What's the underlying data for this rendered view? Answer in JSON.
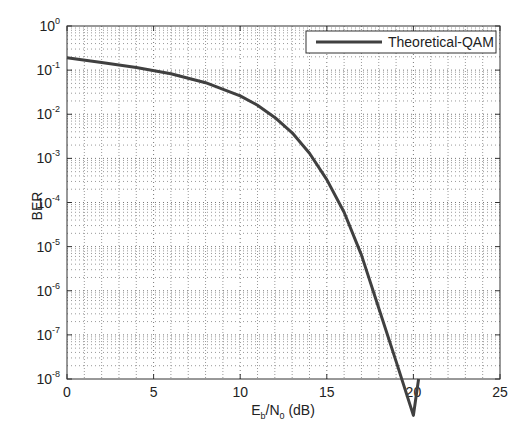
{
  "chart_data": {
    "type": "line",
    "title": "",
    "xlabel": "E_b/N_0 (dB)",
    "xlabel_parts": {
      "base1": "E",
      "sub1": "b",
      "mid": "/N",
      "sub2": "0",
      "tail": " (dB)"
    },
    "ylabel": "BER",
    "xlim": [
      0,
      25
    ],
    "ylim": [
      1e-08,
      1
    ],
    "yscale": "log",
    "grid": true,
    "grid_style": "dotted, major and minor",
    "legend_position": "upper right",
    "x_ticks": [
      "0",
      "5",
      "10",
      "15",
      "20",
      "25"
    ],
    "y_ticks": [
      {
        "base": "10",
        "exp": "0"
      },
      {
        "base": "10",
        "exp": "-1"
      },
      {
        "base": "10",
        "exp": "-2"
      },
      {
        "base": "10",
        "exp": "-3"
      },
      {
        "base": "10",
        "exp": "-4"
      },
      {
        "base": "10",
        "exp": "-5"
      },
      {
        "base": "10",
        "exp": "-6"
      },
      {
        "base": "10",
        "exp": "-7"
      },
      {
        "base": "10",
        "exp": "-8"
      }
    ],
    "series": [
      {
        "name": "Theoretical-QAM",
        "color": "#404040",
        "x": [
          0,
          2,
          4,
          6,
          8,
          10,
          11,
          12,
          13,
          14,
          15,
          16,
          17,
          18,
          19,
          20,
          20.3
        ],
        "values": [
          0.19,
          0.15,
          0.115,
          0.083,
          0.052,
          0.026,
          0.016,
          0.0085,
          0.0038,
          0.0013,
          0.00033,
          6e-05,
          6.5e-06,
          4e-07,
          2.5e-08,
          1.5e-09,
          1e-08
        ]
      }
    ]
  },
  "legend": {
    "label": "Theoretical-QAM"
  }
}
